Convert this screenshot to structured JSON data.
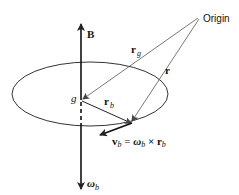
{
  "diagram": {
    "labels": {
      "origin": "Origin",
      "B": "B",
      "g": "g",
      "r_g": "r",
      "r_g_sub": "g",
      "r": "r",
      "r_b": "r",
      "r_b_sub": "b",
      "omega_b": "ω",
      "omega_b_sub": "b",
      "v_eq_v": "v",
      "v_eq_v_sub": "b",
      "v_eq_equals": " = ",
      "v_eq_omega": "ω",
      "v_eq_omega_sub": "b",
      "v_eq_cross": " × ",
      "v_eq_r": "r",
      "v_eq_r_sub": "b"
    },
    "colors": {
      "stroke": "#222222",
      "text": "#111111",
      "thin_line": "#555555"
    }
  }
}
